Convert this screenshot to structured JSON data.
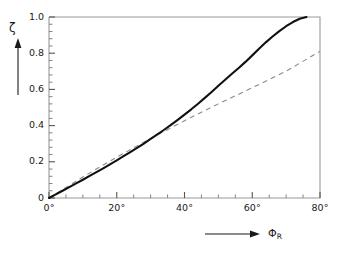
{
  "chart_data": {
    "type": "line",
    "title": "",
    "xlabel": "Φ_R",
    "ylabel": "ζ",
    "xlim": [
      0,
      80
    ],
    "ylim": [
      0,
      1.0
    ],
    "grid": false,
    "legend": "none",
    "x_tick_labels": [
      "0°",
      "20°",
      "40°",
      "60°",
      "80°"
    ],
    "x_tick_values": [
      0,
      20,
      40,
      60,
      80
    ],
    "x_minor_step": 5,
    "y_tick_labels": [
      "0",
      "0.2",
      "0.4",
      "0.6",
      "0.8",
      "1.0"
    ],
    "y_tick_values": [
      0,
      0.2,
      0.4,
      0.6,
      0.8,
      1.0
    ],
    "y_minor_step": 0.04,
    "series": [
      {
        "name": "solid-curve",
        "style": "solid",
        "color": "#111111",
        "x": [
          0,
          2,
          4,
          6,
          8,
          10,
          12,
          14,
          16,
          18,
          20,
          22,
          24,
          26,
          28,
          30,
          32,
          34,
          36,
          38,
          40,
          42,
          44,
          46,
          48,
          50,
          52,
          54,
          56,
          58,
          60,
          62,
          64,
          66,
          68,
          70,
          72,
          74,
          76
        ],
        "y": [
          0.0,
          0.02,
          0.04,
          0.06,
          0.081,
          0.101,
          0.122,
          0.143,
          0.164,
          0.186,
          0.208,
          0.231,
          0.254,
          0.277,
          0.301,
          0.326,
          0.351,
          0.377,
          0.404,
          0.432,
          0.461,
          0.49,
          0.521,
          0.553,
          0.586,
          0.62,
          0.653,
          0.686,
          0.718,
          0.752,
          0.788,
          0.825,
          0.86,
          0.892,
          0.922,
          0.949,
          0.972,
          0.99,
          1.0
        ]
      },
      {
        "name": "dashed-line",
        "style": "dashed",
        "color": "#8a8a8a",
        "x": [
          0,
          10,
          20,
          30,
          40,
          50,
          60,
          70,
          80
        ],
        "y": [
          0.0,
          0.116,
          0.226,
          0.329,
          0.427,
          0.52,
          0.609,
          0.701,
          0.81
        ]
      }
    ],
    "annotations": {
      "y_axis_arrow": "up-arrow",
      "x_axis_arrow": "right-arrow"
    }
  },
  "axes": {
    "y_symbol": "ζ",
    "x_symbol": "Φ",
    "x_symbol_subscript": "R"
  }
}
